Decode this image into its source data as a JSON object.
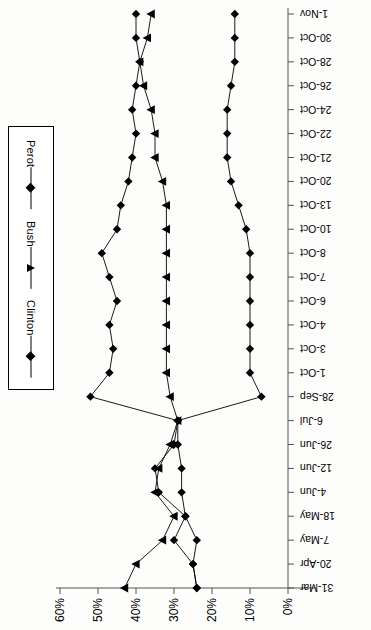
{
  "chart_data": {
    "type": "line",
    "title": "",
    "xlabel": "",
    "ylabel": "",
    "orientation": "rotated-90-upside-down",
    "grid": false,
    "legend_position": "left",
    "value_axis": {
      "label": "",
      "ticks": [
        "60%",
        "50%",
        "40%",
        "30%",
        "20%",
        "10%",
        "0%"
      ],
      "tick_values": [
        60,
        50,
        40,
        30,
        20,
        10,
        0
      ],
      "range": [
        0,
        60
      ],
      "units": "percent"
    },
    "categories": [
      "31-Mar",
      "20-Apr",
      "7-May",
      "18-May",
      "4-Jun",
      "12-Jun",
      "26-Jun",
      "6-Jul",
      "28-Sep",
      "1-Oct",
      "3-Oct",
      "4-Oct",
      "6-Oct",
      "7-Oct",
      "8-Oct",
      "10-Oct",
      "13-Oct",
      "20-Oct",
      "21-Oct",
      "22-Oct",
      "24-Oct",
      "26-Oct",
      "28-Oct",
      "30-Oct",
      "1-Nov"
    ],
    "series": [
      {
        "name": "Clinton",
        "marker": "diamond",
        "color": "#000000",
        "values": [
          24,
          25,
          30,
          27,
          34,
          35,
          30,
          29,
          52,
          47,
          46,
          47,
          45,
          47,
          49,
          45,
          44,
          42,
          41,
          40,
          41,
          40,
          39,
          40,
          40
        ]
      },
      {
        "name": "Bush",
        "marker": "triangle",
        "color": "#000000",
        "values": [
          43,
          40,
          33,
          30,
          35,
          34,
          31,
          29,
          31,
          32,
          32,
          32,
          32,
          32,
          32,
          32,
          32,
          33,
          35,
          35,
          36,
          38,
          39,
          37,
          36
        ]
      },
      {
        "name": "Perot",
        "marker": "diamond",
        "color": "#000000",
        "values": [
          24,
          25,
          24,
          27,
          28,
          28,
          29,
          29,
          7,
          10,
          10,
          10,
          10,
          10,
          10,
          11,
          13,
          15,
          16,
          16,
          16,
          15,
          14,
          14,
          14
        ]
      }
    ]
  },
  "legend": {
    "items": [
      {
        "label": "Clinton",
        "marker": "diamond"
      },
      {
        "label": "Bush",
        "marker": "triangle"
      },
      {
        "label": "Perot",
        "marker": "diamond"
      }
    ]
  }
}
